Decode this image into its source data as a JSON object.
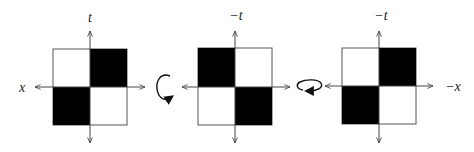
{
  "diagram": {
    "colors": {
      "fill": "#000000",
      "stroke": "#555555",
      "axis": "#444444",
      "label": "#222222",
      "background": "#ffffff"
    },
    "panels": [
      {
        "id": "panel-1",
        "vertical_axis_label": "t",
        "horizontal_axis_label": "x",
        "horizontal_label_side": "left",
        "filled_quadrants": [
          "top-right",
          "bottom-left"
        ]
      },
      {
        "id": "panel-2",
        "vertical_axis_label": "−t",
        "horizontal_axis_label": "",
        "filled_quadrants": [
          "top-left",
          "bottom-right"
        ]
      },
      {
        "id": "panel-3",
        "vertical_axis_label": "−t",
        "horizontal_axis_label": "−x",
        "horizontal_label_side": "right",
        "filled_quadrants": [
          "top-right",
          "bottom-left"
        ]
      }
    ],
    "transitions": [
      {
        "between": [
          "panel-1",
          "panel-2"
        ],
        "icon": "rotation-about-horizontal-axis-icon"
      },
      {
        "between": [
          "panel-2",
          "panel-3"
        ],
        "icon": "rotation-about-vertical-axis-icon"
      }
    ]
  }
}
